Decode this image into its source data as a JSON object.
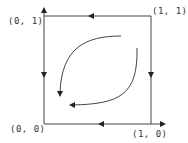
{
  "diagram": {
    "type": "phase-diagram",
    "labels": {
      "top_left": "(0, 1)",
      "top_right": "(1, 1)",
      "bottom_left": "(0, 0)",
      "bottom_right": "(1, 0)"
    },
    "colors": {
      "line": "#333333",
      "background": "#ffffff"
    },
    "edges": [
      {
        "from": "(1, 1)",
        "to": "(0, 1)",
        "direction": "left"
      },
      {
        "from": "(0, 1)",
        "to": "(0, 0)",
        "direction": "down"
      },
      {
        "from": "(1, 0)",
        "to": "(0, 0)",
        "direction": "left"
      },
      {
        "from": "(1, 1)",
        "to": "(1, 0)",
        "direction": "down"
      }
    ],
    "axes": {
      "y_arrow": "up",
      "x_arrow": "right"
    },
    "interior_trajectories": [
      {
        "shape": "counterclockwise curve from upper right to lower left",
        "arrow": "down"
      },
      {
        "shape": "curve from right downward then left",
        "arrow": "left"
      }
    ]
  }
}
